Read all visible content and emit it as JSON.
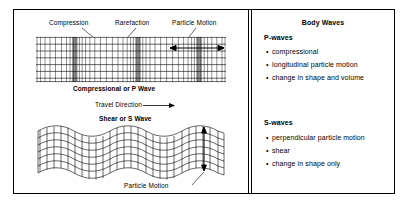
{
  "figure": {
    "left_panel": {
      "labels": {
        "compression": "Compression",
        "rarefaction": "Rarefaction",
        "particle_motion_top": "Particle Motion",
        "p_wave_caption": "Compressional or P Wave",
        "travel_direction": "Travel Direction",
        "s_wave_caption": "Shear or S Wave",
        "particle_motion_bottom": "Particle Motion"
      },
      "diagrams": [
        {
          "name": "p-wave-grid",
          "type": "compressional",
          "rows": 7,
          "columns": 34,
          "compression_bands": [
            4,
            13,
            22,
            31
          ],
          "arrow": "horizontal-double-headed"
        },
        {
          "name": "s-wave-grid",
          "type": "shear",
          "rows": 7,
          "columns": 26,
          "wavelengths": 2,
          "arrow": "vertical-double-headed"
        }
      ]
    },
    "right_panel": {
      "title": "Body Waves",
      "sections": [
        {
          "heading": "P-waves",
          "bullets": [
            "compressional",
            "longitudinal particle motion",
            "change in shape and volume"
          ]
        },
        {
          "heading": "S-waves",
          "bullets": [
            "perpendicular particle motion",
            "shear",
            "change in shape only"
          ]
        }
      ]
    }
  },
  "colors": {
    "background": "#ffffff",
    "line": "#000000",
    "grid": "#1a1a1a",
    "compression_band": "#555555"
  }
}
